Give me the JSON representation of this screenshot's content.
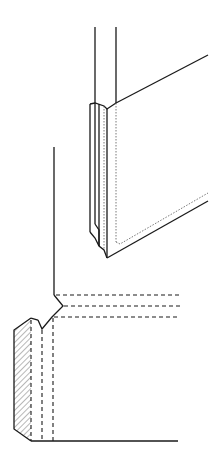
{
  "diagram": {
    "title": "",
    "colors": {
      "line": "#1a1a1a",
      "background": "#ffffff"
    },
    "parts": [
      {
        "id": "upper-view",
        "label": ""
      },
      {
        "id": "lower-section",
        "label": ""
      }
    ]
  }
}
